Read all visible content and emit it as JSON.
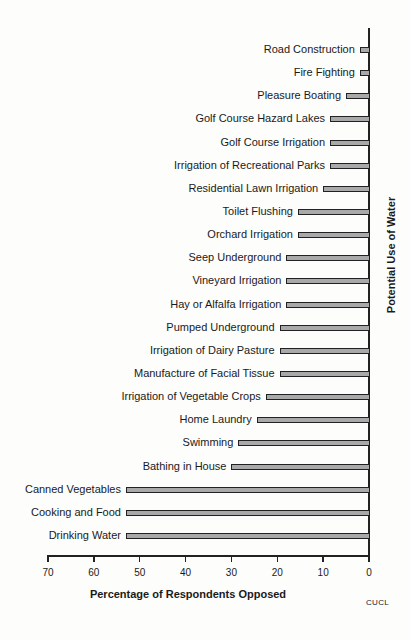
{
  "chart_data": {
    "type": "bar",
    "orientation": "horizontal",
    "title": "",
    "xlabel": "Percentage of Respondents Opposed",
    "ylabel": "Potential Use of Water",
    "xlim": [
      70,
      0
    ],
    "x_reversed": true,
    "x_ticks": [
      70,
      60,
      50,
      40,
      30,
      20,
      10,
      0
    ],
    "grid": false,
    "legend": null,
    "categories": [
      "Road Construction",
      "Fire Fighting",
      "Pleasure Boating",
      "Golf Course Hazard Lakes",
      "Golf Course Irrigation",
      "Irrigation of  Recreational Parks",
      "Residential Lawn Irrigation",
      "Toilet Flushing",
      "Orchard Irrigation",
      "Seep Underground",
      "Vineyard Irrigation",
      "Hay or Alfalfa Irrigation",
      "Pumped Underground",
      "Irrigation of  Dairy Pasture",
      "Manufacture of Facial Tissue",
      "Irrigation  of Vegetable Crops",
      "Home Laundry",
      "Swimming",
      "Bathing in House",
      "Canned Vegetables",
      "Cooking and Food",
      "Drinking Water"
    ],
    "values": [
      2,
      2,
      5,
      8.5,
      8.5,
      8.5,
      10,
      15.5,
      15.5,
      18,
      18,
      18,
      19.5,
      19.5,
      19.5,
      22.5,
      24.5,
      28.5,
      30,
      53,
      53,
      53
    ],
    "bar_color": "#a9a9a9",
    "bar_edge_color": "#222222"
  },
  "credit": "CUCL"
}
